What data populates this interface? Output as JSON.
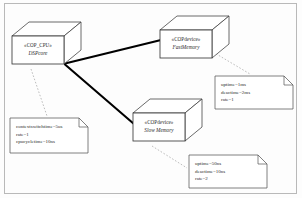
{
  "diagram": {
    "type": "uml-deployment-diagram",
    "border_color": "#b9b9b9",
    "node_stroke": "#3a3a3a",
    "association_color": "#000000",
    "dashed_color": "#9a9a9a",
    "nodes": [
      {
        "id": "cpu",
        "stereotype": "«COP_CPU»",
        "name": "DSPcore",
        "x": 12,
        "y": 36,
        "w": 52,
        "h": 28,
        "depth_x": 17,
        "depth_y": 14
      },
      {
        "id": "fastmem",
        "stereotype": "«COPdevice»",
        "name": "FastMemory",
        "x": 160,
        "y": 30,
        "w": 52,
        "h": 28,
        "depth_x": 17,
        "depth_y": 14
      },
      {
        "id": "slowmem",
        "stereotype": "«COPdevice»",
        "name": "Slow Memory",
        "x": 133,
        "y": 113,
        "w": 52,
        "h": 28,
        "depth_x": 17,
        "depth_y": 14
      }
    ],
    "associations": [
      {
        "id": "cpu-fastmem",
        "from": "cpu",
        "to": "fastmem",
        "x1": 66,
        "y1": 63,
        "x2": 160,
        "y2": 40
      },
      {
        "id": "cpu-slowmem",
        "from": "cpu",
        "to": "slowmem",
        "x1": 66,
        "y1": 64,
        "x2": 133,
        "y2": 124
      }
    ],
    "notes": [
      {
        "id": "cpu-note",
        "x": 10,
        "y": 118,
        "w": 78,
        "h": 35,
        "fold": 9,
        "lines": [
          "contextswitchtime=5us",
          "rate=1",
          "cpucycletime=10ns"
        ],
        "anchor": {
          "x1": 31,
          "y1": 69,
          "x2": 47,
          "y2": 116
        }
      },
      {
        "id": "fastmem-note",
        "x": 215,
        "y": 76,
        "w": 78,
        "h": 33,
        "fold": 9,
        "lines": [
          "uptime=1ms",
          "deactime=2ms",
          "rate=1"
        ],
        "anchor": {
          "x1": 213,
          "y1": 52,
          "x2": 250,
          "y2": 74
        }
      },
      {
        "id": "slowmem-note",
        "x": 189,
        "y": 155,
        "w": 78,
        "h": 33,
        "fold": 9,
        "lines": [
          "uptime=50ns",
          "deactime=10ns",
          "rate=2"
        ],
        "anchor": {
          "x1": 152,
          "y1": 146,
          "x2": 187,
          "y2": 168
        }
      }
    ]
  }
}
